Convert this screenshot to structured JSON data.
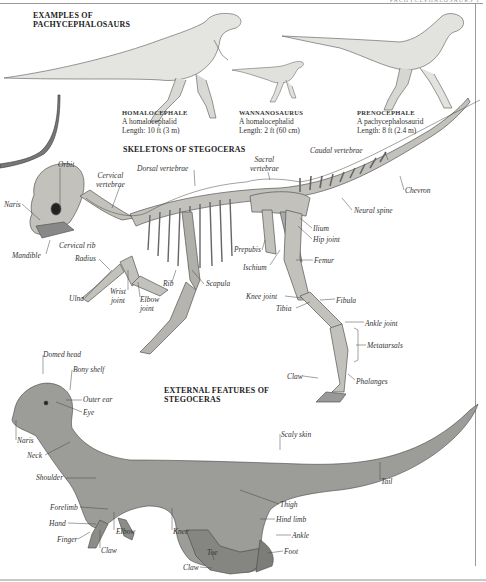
{
  "page": {
    "running_head": "PACHYCEPHALOSAURS",
    "page_number": "1"
  },
  "examples": {
    "heading_line1": "EXAMPLES OF",
    "heading_line2": "PACHYCEPHALOSAURS",
    "species": [
      {
        "name": "HOMALOCEPHALE",
        "description": "A homalocephalid",
        "length": "Length: 10 ft (3 m)"
      },
      {
        "name": "WANNANOSAURUS",
        "description": "A homalocephalid",
        "length": "Length: 2 ft (60 cm)"
      },
      {
        "name": "PRENOCEPHALE",
        "description": "A pachycephalosaurid",
        "length": "Length: 8 ft (2.4 m)"
      }
    ]
  },
  "skeleton": {
    "heading": "SKELETONS OF STEGOCERAS",
    "labels": {
      "orbit": "Orbit",
      "naris": "Naris",
      "cervical_vertebrae_1": "Cervical",
      "cervical_vertebrae_2": "vertebrae",
      "dorsal_vertebrae": "Dorsal vertebrae",
      "sacral_vertebrae_1": "Sacral",
      "sacral_vertebrae_2": "vertebrae",
      "caudal_vertebrae": "Caudal vertebrae",
      "chevron": "Chevron",
      "neural_spine": "Neural spine",
      "ilium": "Ilium",
      "hip_joint": "Hip joint",
      "prepubis": "Prepubis",
      "ischium": "Ischium",
      "femur": "Femur",
      "mandible": "Mandible",
      "cervical_rib": "Cervical rib",
      "radius": "Radius",
      "ulna": "Ulna",
      "wrist_joint_1": "Wrist",
      "wrist_joint_2": "joint",
      "elbow_joint_1": "Elbow",
      "elbow_joint_2": "joint",
      "rib": "Rib",
      "scapula": "Scapula",
      "knee_joint": "Knee joint",
      "tibia": "Tibia",
      "fibula": "Fibula",
      "ankle_joint": "Ankle joint",
      "metatarsals": "Metatarsals",
      "claw": "Claw",
      "phalanges": "Phalanges"
    }
  },
  "external": {
    "heading_line1": "EXTERNAL FEATURES OF",
    "heading_line2": "STEGOCERAS",
    "labels": {
      "domed_head": "Domed head",
      "bony_shelf": "Bony shelf",
      "outer_ear": "Outer ear",
      "eye": "Eye",
      "naris": "Naris",
      "neck": "Neck",
      "shoulder": "Shoulder",
      "forelimb": "Forelimb",
      "hand": "Hand",
      "finger": "Finger",
      "claw_hand": "Claw",
      "elbow": "Elbow",
      "knee": "Knee",
      "toe": "Toe",
      "claw_foot": "Claw",
      "scaly_skin": "Scaly skin",
      "tail": "Tail",
      "thigh": "Thigh",
      "hind_limb": "Hind limb",
      "ankle": "Ankle",
      "foot": "Foot"
    }
  },
  "colors": {
    "ink": "#222222",
    "label": "#333333",
    "skin": "#9a9a96",
    "bone": "#b9b8b2",
    "rule": "#9a9a9a"
  }
}
